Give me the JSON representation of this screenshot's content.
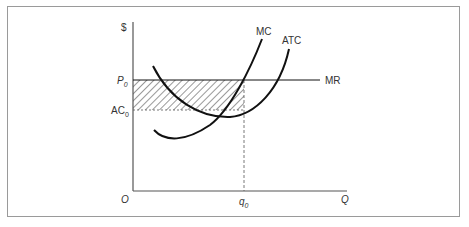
{
  "diagram": {
    "type": "economics-firm-profit",
    "axes": {
      "y_label": "$",
      "x_label": "Q",
      "origin_label": "O"
    },
    "curves": [
      {
        "name": "MC",
        "label": "MC"
      },
      {
        "name": "ATC",
        "label": "ATC"
      },
      {
        "name": "MR",
        "label": "MR"
      }
    ],
    "y_ticks": [
      {
        "label": "P",
        "subscript": "0"
      },
      {
        "label": "AC",
        "subscript": "0"
      }
    ],
    "x_ticks": [
      {
        "label": "q",
        "subscript": "0"
      }
    ],
    "shaded_region": "profit rectangle between P0 and AC0 from O to q0",
    "colors": {
      "line": "#111111",
      "axis": "#555555",
      "frame": "#9a9a9a",
      "text": "#333333"
    }
  }
}
